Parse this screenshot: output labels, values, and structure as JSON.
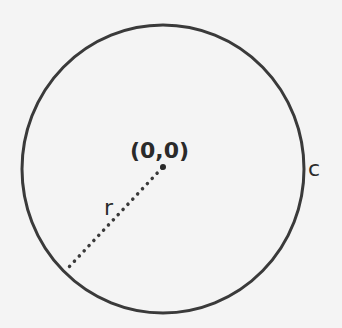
{
  "diagram": {
    "type": "circle-geometry",
    "labels": {
      "center": "(0,0)",
      "radius": "r",
      "circumference": "c"
    },
    "colors": {
      "background": "#f4f4f4",
      "stroke": "#3a3a3a",
      "text": "#2a2a2a"
    }
  }
}
